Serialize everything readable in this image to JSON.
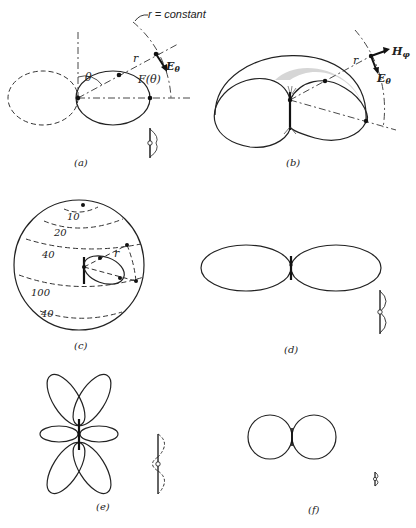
{
  "figure": {
    "panels": [
      {
        "id": "a",
        "caption": "(a)",
        "labels": {
          "r_constant": "r = constant",
          "r": "r",
          "theta": "θ",
          "F_theta": "F(θ)",
          "E_theta": "E",
          "E_sub": "θ"
        }
      },
      {
        "id": "b",
        "caption": "(b)",
        "labels": {
          "r": "r",
          "H_phi": "H",
          "H_sub": "φ",
          "E_theta": "E",
          "E_sub": "θ"
        }
      },
      {
        "id": "c",
        "caption": "(c)",
        "labels": {
          "r": "r",
          "contours": [
            "10",
            "20",
            "40",
            "100",
            "40"
          ]
        }
      },
      {
        "id": "d",
        "caption": "(d)"
      },
      {
        "id": "e",
        "caption": "(e)"
      },
      {
        "id": "f",
        "caption": "(f)"
      }
    ]
  }
}
